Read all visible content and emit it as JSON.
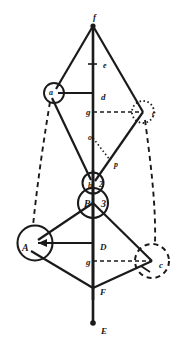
{
  "figure": {
    "background_color": "#ffffff",
    "stroke_color": "#1a1a1a",
    "width": 189,
    "height": 353,
    "labels": [
      {
        "id": "f",
        "text": "f",
        "x": 93,
        "y": 13,
        "size": "md"
      },
      {
        "id": "e",
        "text": "e",
        "x": 103,
        "y": 62,
        "size": "sm"
      },
      {
        "id": "a",
        "text": "a",
        "x": 49,
        "y": 89,
        "size": "sm"
      },
      {
        "id": "d",
        "text": "d",
        "x": 101,
        "y": 93,
        "size": "md"
      },
      {
        "id": "g1",
        "text": "g",
        "x": 86,
        "y": 108,
        "size": "md"
      },
      {
        "id": "c1",
        "text": "c",
        "x": 152,
        "y": 110,
        "size": "sm"
      },
      {
        "id": "o",
        "text": "o",
        "x": 88,
        "y": 134,
        "size": "sm"
      },
      {
        "id": "p",
        "text": "p",
        "x": 114,
        "y": 161,
        "size": "sm"
      },
      {
        "id": "b",
        "text": "b",
        "x": 88,
        "y": 182,
        "size": "sm"
      },
      {
        "id": "2",
        "text": "2",
        "x": 99,
        "y": 181,
        "size": "sm"
      },
      {
        "id": "B",
        "text": "B",
        "x": 84,
        "y": 199,
        "size": "lg"
      },
      {
        "id": "3",
        "text": "3",
        "x": 101,
        "y": 199,
        "size": "lg"
      },
      {
        "id": "A",
        "text": "A",
        "x": 22,
        "y": 243,
        "size": "lg"
      },
      {
        "id": "D",
        "text": "D",
        "x": 100,
        "y": 243,
        "size": "md"
      },
      {
        "id": "g2",
        "text": "g",
        "x": 86,
        "y": 258,
        "size": "md"
      },
      {
        "id": "c2",
        "text": "c",
        "x": 159,
        "y": 261,
        "size": "md"
      },
      {
        "id": "F",
        "text": "F",
        "x": 100,
        "y": 288,
        "size": "md"
      },
      {
        "id": "E",
        "text": "E",
        "x": 101,
        "y": 327,
        "size": "md"
      }
    ],
    "points": {
      "f": {
        "x": 93,
        "y": 25
      },
      "e": {
        "x": 93,
        "y": 65
      },
      "a": {
        "x": 54,
        "y": 93
      },
      "d": {
        "x": 93,
        "y": 93
      },
      "g_up": {
        "x": 93,
        "y": 112
      },
      "c_up": {
        "x": 143,
        "y": 112
      },
      "o": {
        "x": 93,
        "y": 137
      },
      "p": {
        "x": 110,
        "y": 157
      },
      "b": {
        "x": 93,
        "y": 183
      },
      "B": {
        "x": 93,
        "y": 203
      },
      "A": {
        "x": 35,
        "y": 243
      },
      "D": {
        "x": 93,
        "y": 243
      },
      "g_low": {
        "x": 93,
        "y": 261
      },
      "c_low": {
        "x": 152,
        "y": 261
      },
      "F": {
        "x": 93,
        "y": 288
      },
      "E": {
        "x": 93,
        "y": 323
      }
    },
    "circles": [
      {
        "id": "circle-a",
        "cx": 54,
        "cy": 93,
        "r": 10,
        "style": "solid"
      },
      {
        "id": "circle-c-upper",
        "cx": 143,
        "cy": 112,
        "r": 11,
        "style": "dotted"
      },
      {
        "id": "circle-b",
        "cx": 93,
        "cy": 183,
        "r": 10.5,
        "style": "solid"
      },
      {
        "id": "circle-B",
        "cx": 93,
        "cy": 203,
        "r": 15,
        "style": "solid"
      },
      {
        "id": "circle-A",
        "cx": 35,
        "cy": 243,
        "r": 17.5,
        "style": "solid"
      },
      {
        "id": "circle-c-lower",
        "cx": 152,
        "cy": 261,
        "r": 17,
        "style": "dashed"
      }
    ]
  }
}
